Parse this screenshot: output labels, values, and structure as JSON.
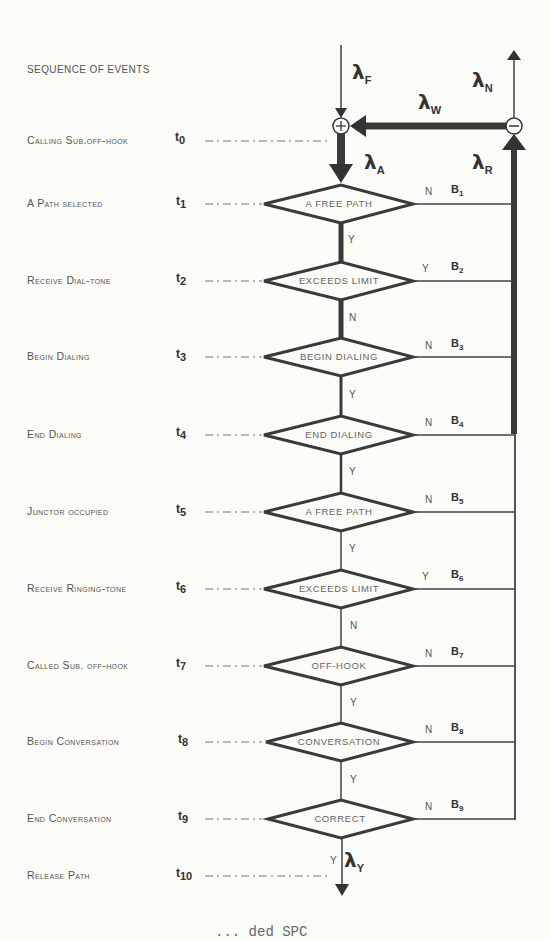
{
  "title": "SEQUENCE OF EVENTS",
  "events": [
    {
      "label": "Calling Sub.off-hook",
      "t": "t",
      "tsub": "0"
    },
    {
      "label": "A Path selected",
      "t": "t",
      "tsub": "1",
      "decision": "A FREE PATH",
      "down": "Y",
      "branch": "N",
      "b": "B",
      "bsub": "1"
    },
    {
      "label": "Receive Dial-tone",
      "t": "t",
      "tsub": "2",
      "decision": "EXCEEDS LIMIT",
      "down": "N",
      "branch": "Y",
      "b": "B",
      "bsub": "2"
    },
    {
      "label": "Begin Dialing",
      "t": "t",
      "tsub": "3",
      "decision": "BEGIN DIALING",
      "down": "Y",
      "branch": "N",
      "b": "B",
      "bsub": "3"
    },
    {
      "label": "End Dialing",
      "t": "t",
      "tsub": "4",
      "decision": "END DIALING",
      "down": "Y",
      "branch": "N",
      "b": "B",
      "bsub": "4"
    },
    {
      "label": "Junctor occupied",
      "t": "t",
      "tsub": "5",
      "decision": "A FREE PATH",
      "down": "Y",
      "branch": "N",
      "b": "B",
      "bsub": "5"
    },
    {
      "label": "Receive Ringing-tone",
      "t": "t",
      "tsub": "6",
      "decision": "EXCEEDS LIMIT",
      "down": "N",
      "branch": "Y",
      "b": "B",
      "bsub": "6"
    },
    {
      "label": "Called Sub. off-hook",
      "t": "t",
      "tsub": "7",
      "decision": "OFF-HOOK",
      "down": "Y",
      "branch": "N",
      "b": "B",
      "bsub": "7"
    },
    {
      "label": "Begin Conversation",
      "t": "t",
      "tsub": "8",
      "decision": "CONVERSATION",
      "down": "Y",
      "branch": "N",
      "b": "B",
      "bsub": "8"
    },
    {
      "label": "End Conversation",
      "t": "t",
      "tsub": "9",
      "decision": "CORRECT",
      "down": "Y",
      "branch": "N",
      "b": "B",
      "bsub": "9"
    },
    {
      "label": "Release Path",
      "t": "t",
      "tsub": "10"
    }
  ],
  "lambdas": {
    "F": {
      "sym": "λ",
      "sub": "F"
    },
    "N": {
      "sym": "λ",
      "sub": "N"
    },
    "W": {
      "sym": "λ",
      "sub": "W"
    },
    "A": {
      "sym": "λ",
      "sub": "A"
    },
    "R": {
      "sym": "λ",
      "sub": "R"
    },
    "Y": {
      "sym": "λ",
      "sub": "Y"
    }
  },
  "junctions": {
    "plus": "+",
    "minus": "−"
  },
  "caption_fragment": "... ded SPC"
}
